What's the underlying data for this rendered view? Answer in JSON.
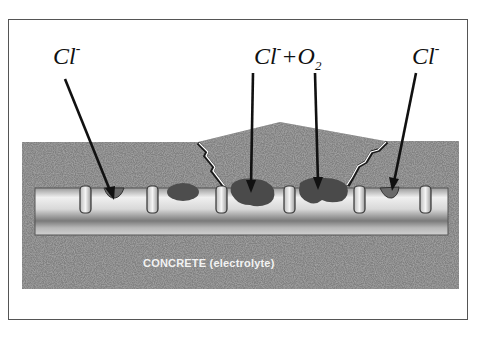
{
  "diagram": {
    "labels": {
      "left": {
        "base": "Cl",
        "sup": "-"
      },
      "center": {
        "base": "Cl",
        "sup": "-",
        "plus": "+",
        "o": "O",
        "sub": "2"
      },
      "right": {
        "base": "Cl",
        "sup": "-"
      }
    },
    "concrete_label": "CONCRETE (electrolyte)",
    "colors": {
      "concrete": "#7e7e7e",
      "rebar_light": "#e6e6e6",
      "rebar_dark": "#8a8a8a",
      "corrosion": "#4a4a4a",
      "arrow": "#111111",
      "frame": "#555555"
    }
  }
}
